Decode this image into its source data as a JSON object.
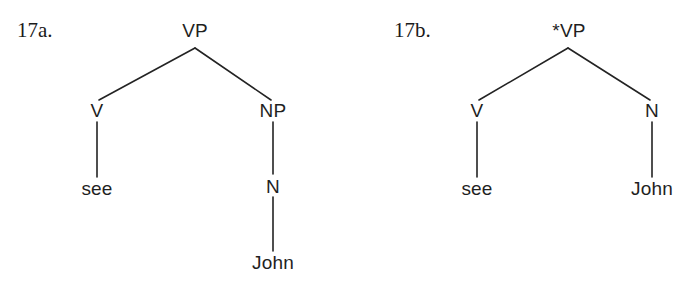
{
  "figure": {
    "type": "syntax-tree-pair",
    "background_color": "#ffffff",
    "line_color": "#232323",
    "text_color": "#1f1f1f"
  },
  "trees": [
    {
      "id": "17a",
      "example_label": "17a.",
      "grammatical": true,
      "sentence": "see John",
      "nodes": {
        "root": "VP",
        "left_child": "V",
        "left_leaf": "see",
        "right_child": "NP",
        "right_grandchild": "N",
        "right_leaf": "John"
      }
    },
    {
      "id": "17b",
      "example_label": "17b.",
      "grammatical": false,
      "sentence": "see John",
      "nodes": {
        "root": "*VP",
        "left_child": "V",
        "left_leaf": "see",
        "right_child": "N",
        "right_leaf": "John"
      }
    }
  ]
}
